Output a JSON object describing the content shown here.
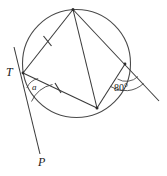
{
  "figure": {
    "stroke_color": "#3a3a3a",
    "label_color": "#1a1a1a",
    "background": "#ffffff",
    "width": 167,
    "height": 176
  },
  "circle": {
    "cx": 76.5,
    "cy": 63.5,
    "r": 54.0
  },
  "points": {
    "T": {
      "x": 23,
      "y": 73,
      "label": "T"
    },
    "top": {
      "x": 73,
      "y": 9.5
    },
    "right": {
      "x": 125,
      "y": 64
    },
    "bottom": {
      "x": 97,
      "y": 108
    },
    "P": {
      "x": 40,
      "y": 154,
      "label": "P"
    },
    "tangent_top": {
      "x": 14,
      "y": 47
    },
    "secant_end": {
      "x": 159,
      "y": 101
    }
  },
  "labels": {
    "t_point": "T",
    "p_point": "P",
    "angle_a": "a",
    "angle_80": "80°"
  },
  "ticks": [
    {
      "name": "tick-chord-T-top",
      "x": 47.5,
      "y": 41,
      "angle": -52
    },
    {
      "name": "tick-chord-T-bottom",
      "x": 58,
      "y": 88,
      "angle": 23
    }
  ],
  "arcs": {
    "angle_a_label": "a",
    "angle_80_label": "80°"
  }
}
